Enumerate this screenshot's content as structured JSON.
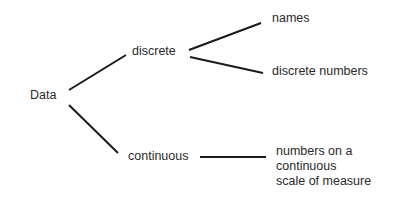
{
  "diagram": {
    "type": "tree",
    "nodes": {
      "root": {
        "label": "Data"
      },
      "discrete": {
        "label": "discrete"
      },
      "continuous": {
        "label": "continuous"
      },
      "names": {
        "label": "names"
      },
      "discrete_numbers": {
        "label": "discrete numbers"
      },
      "continuous_desc": {
        "lines": [
          "numbers on a",
          "continuous",
          "scale of measure"
        ]
      }
    },
    "edges": [
      {
        "from": "Data",
        "to": "discrete"
      },
      {
        "from": "Data",
        "to": "continuous"
      },
      {
        "from": "discrete",
        "to": "names"
      },
      {
        "from": "discrete",
        "to": "discrete numbers"
      },
      {
        "from": "continuous",
        "to": "numbers on a continuous scale of measure"
      }
    ],
    "colors": {
      "line": "#1a1a1a",
      "text": "#2a2a2a",
      "background": "#ffffff"
    }
  }
}
